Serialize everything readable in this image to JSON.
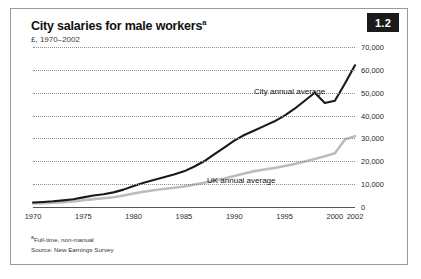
{
  "figure": {
    "badge": "1.2",
    "title": "City salaries for male workers",
    "title_superscript": "a",
    "subtitle": "£, 1970–2002",
    "footnote": "a Full-time, non-manual",
    "footnote_marker": "a",
    "footnote_text": "Full-time, non-manual",
    "source": "Source: New Earnings Survey",
    "colors": {
      "city_line": "#1a1a1a",
      "uk_line": "#bcbcbc",
      "gridline": "#8c8c8c",
      "badge_background": "#1b1b1b",
      "badge_text": "#ffffff",
      "frame_border": "#9a9a9a"
    }
  },
  "chart_data": {
    "type": "line",
    "title": "City salaries for male workers",
    "subtitle": "£, 1970–2002",
    "xlabel": "",
    "ylabel": "£",
    "xlim": [
      1970,
      2002
    ],
    "ylim": [
      0,
      70000
    ],
    "ytick_labels": [
      "70,000",
      "60,000",
      "50,000",
      "40,000",
      "30,000",
      "20,000",
      "10,000",
      "0"
    ],
    "ytick_values": [
      70000,
      60000,
      50000,
      40000,
      30000,
      20000,
      10000,
      0
    ],
    "xtick_labels": [
      "1970",
      "1975",
      "1980",
      "1985",
      "1990",
      "1995",
      "2000",
      "2002"
    ],
    "xtick_values": [
      1970,
      1975,
      1980,
      1985,
      1990,
      1995,
      2000,
      2002
    ],
    "grid": "horizontal-dotted",
    "legend_position": "inline-annotation",
    "x": [
      1970,
      1971,
      1972,
      1973,
      1974,
      1975,
      1976,
      1977,
      1978,
      1979,
      1980,
      1981,
      1982,
      1983,
      1984,
      1985,
      1986,
      1987,
      1988,
      1989,
      1990,
      1991,
      1992,
      1993,
      1994,
      1995,
      1996,
      1997,
      1998,
      1999,
      2000,
      2001,
      2002
    ],
    "series": [
      {
        "name": "City annual average",
        "color": "#1a1a1a",
        "values": [
          2000,
          2200,
          2500,
          2900,
          3400,
          4200,
          5000,
          5600,
          6400,
          7600,
          9200,
          10600,
          11800,
          13000,
          14200,
          15600,
          17600,
          20000,
          23000,
          26000,
          29000,
          31500,
          33500,
          35500,
          37500,
          40000,
          43000,
          46500,
          50000,
          45500,
          46500,
          54000,
          62000
        ]
      },
      {
        "name": "UK annual average",
        "color": "#bcbcbc",
        "values": [
          1500,
          1650,
          1850,
          2100,
          2450,
          2950,
          3450,
          3800,
          4300,
          5000,
          5900,
          6700,
          7300,
          7900,
          8400,
          9000,
          9800,
          10600,
          11500,
          12500,
          13600,
          14700,
          15700,
          16400,
          17100,
          17900,
          18800,
          19900,
          21000,
          22200,
          23500,
          29500,
          31000
        ]
      }
    ],
    "annotations": [
      {
        "text": "City annual average",
        "series": "City annual average"
      },
      {
        "text": "UK annual average",
        "series": "UK annual average"
      }
    ]
  }
}
